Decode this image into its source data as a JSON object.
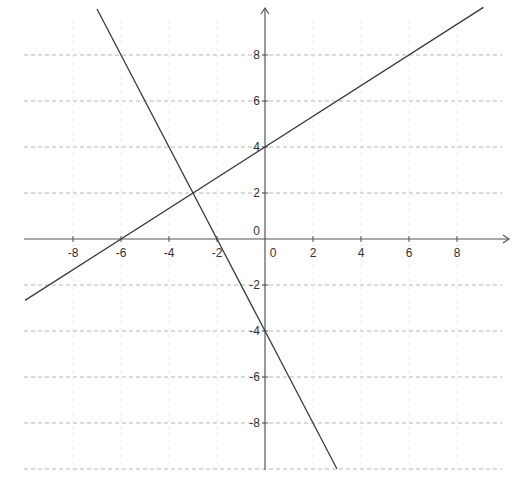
{
  "chart_data": {
    "type": "line",
    "title": "",
    "xlabel": "",
    "ylabel": "",
    "xlim": [
      -10,
      10
    ],
    "ylim": [
      -10,
      10
    ],
    "grid": {
      "horizontal": true,
      "vertical": "faint",
      "style": "dashed",
      "step": 2
    },
    "legend": null,
    "x_ticks": [
      -8,
      -6,
      -4,
      -2,
      0,
      2,
      4,
      6,
      8
    ],
    "y_ticks": [
      8,
      6,
      4,
      2,
      0,
      -2,
      -4,
      -6,
      -8
    ],
    "x_tick_labels": [
      "-8",
      "-6",
      "-4",
      "-2",
      "0",
      "2",
      "4",
      "6",
      "8"
    ],
    "y_tick_labels": [
      "8",
      "6",
      "4",
      "2",
      "0",
      "-2",
      "-4",
      "-6",
      "-8"
    ],
    "series": [
      {
        "name": "line-positive-slope",
        "equation": "y = (2/3)x + 4",
        "slope": 0.6667,
        "intercept": 4,
        "x_intercept": -6,
        "x": [
          -10,
          9.1
        ],
        "y": [
          -2.67,
          10.07
        ],
        "color": "#3a3a3a"
      },
      {
        "name": "line-negative-slope",
        "equation": "y = -2x - 4",
        "slope": -2,
        "intercept": -4,
        "x_intercept": -2,
        "x": [
          -7,
          3
        ],
        "y": [
          10,
          -10
        ],
        "color": "#3a3a3a"
      }
    ],
    "annotations": [
      {
        "type": "intersection",
        "x": -3,
        "y": 2
      }
    ]
  },
  "layout": {
    "origin_px": {
      "x": 265,
      "y": 239
    },
    "px_per_unit_x": 24,
    "px_per_unit_y": 23,
    "plot_left_px": 24,
    "plot_right_px": 502,
    "plot_top_px": 8,
    "plot_bottom_px": 470
  }
}
